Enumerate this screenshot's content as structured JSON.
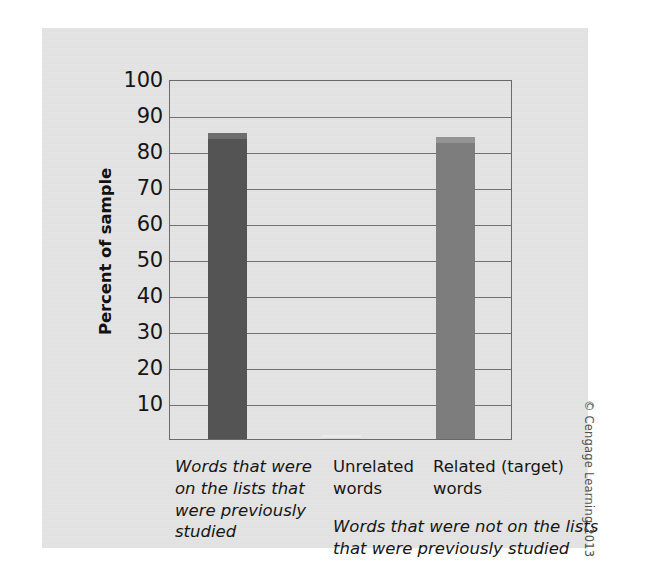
{
  "figure": {
    "credit": "© Cengage Learning 2013",
    "panel_color": "#e4e4e4",
    "page_background": "#ffffff"
  },
  "chart_data": {
    "type": "bar",
    "title": "",
    "xlabel": "",
    "ylabel": "Percent of sample",
    "ylim": [
      0,
      100
    ],
    "grid": true,
    "legend": "none",
    "categories": [
      "Words that were on the lists that were previously studied",
      "Unrelated words",
      "Related (target) words"
    ],
    "category_labels_display": [
      "Words that were on the lists that were previously studied",
      "Unrelated words",
      "Related (target) words"
    ],
    "values": [
      85,
      1,
      84
    ],
    "bar_colors": [
      "#545454",
      "#d8d8d8",
      "#7d7d7d"
    ],
    "bar_cap_colors": [
      "#6e6e6e",
      "#eaeaea",
      "#949494"
    ],
    "ytick_labels": [
      "100",
      "90",
      "80",
      "70",
      "60",
      "50",
      "40",
      "30",
      "20",
      "10"
    ],
    "ytick_values": [
      100,
      90,
      80,
      70,
      60,
      50,
      40,
      30,
      20,
      10
    ],
    "annotations": [
      "Words that were not on the lists that were previously studied"
    ]
  },
  "axis": {
    "y_title": "Percent of sample"
  },
  "labels": {
    "sub_caption": "Words that were not on the lists that were previously studied"
  }
}
